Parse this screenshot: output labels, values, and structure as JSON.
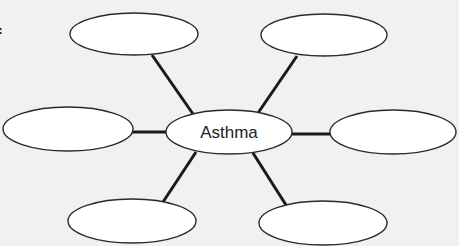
{
  "diagram": {
    "type": "web-organizer",
    "center": {
      "label": "Asthma",
      "cx": 229,
      "cy": 132,
      "rx": 63,
      "ry": 22
    },
    "satellites": [
      {
        "position": "top-left",
        "label": "",
        "cx": 134,
        "cy": 34,
        "rx": 64,
        "ry": 21
      },
      {
        "position": "top-right",
        "label": "",
        "cx": 324,
        "cy": 35,
        "rx": 63,
        "ry": 21
      },
      {
        "position": "left",
        "label": "",
        "cx": 68,
        "cy": 129,
        "rx": 65,
        "ry": 22
      },
      {
        "position": "right",
        "label": "",
        "cx": 393,
        "cy": 132,
        "rx": 63,
        "ry": 22
      },
      {
        "position": "bottom-left",
        "label": "",
        "cx": 132,
        "cy": 221,
        "rx": 64,
        "ry": 22
      },
      {
        "position": "bottom-right",
        "label": "",
        "cx": 323,
        "cy": 223,
        "rx": 64,
        "ry": 22
      }
    ],
    "cropped_text": "f"
  }
}
